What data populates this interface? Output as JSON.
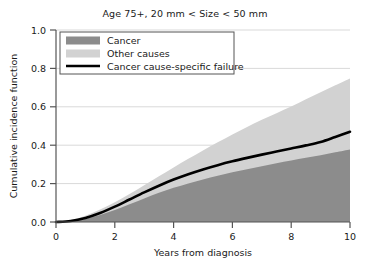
{
  "chart_data": {
    "type": "area",
    "title": "Age 75+, 20 mm < Size < 50 mm",
    "xlabel": "Years from diagnosis",
    "ylabel": "Cumulative incidence function",
    "xlim": [
      0,
      10
    ],
    "ylim": [
      0,
      1.0
    ],
    "xticks": [
      0,
      2,
      4,
      6,
      8,
      10
    ],
    "xtick_labels": [
      "0",
      "2",
      "4",
      "6",
      "8",
      "10"
    ],
    "yticks": [
      0.0,
      0.2,
      0.4,
      0.6,
      0.8,
      1.0
    ],
    "ytick_labels": [
      "0.0",
      "0.2",
      "0.4",
      "0.6",
      "0.8",
      "1.0"
    ],
    "grid": "horizontal",
    "stacked": true,
    "legend_position": "upper-left-inside",
    "x": [
      0,
      0.5,
      1,
      1.5,
      2,
      2.5,
      3,
      3.5,
      4,
      4.5,
      5,
      5.5,
      6,
      6.5,
      7,
      7.5,
      8,
      8.5,
      9,
      9.5,
      10
    ],
    "series": [
      {
        "name": "Cancer",
        "kind": "area",
        "color": "#8c8c8c",
        "values": [
          0.0,
          0.004,
          0.016,
          0.036,
          0.062,
          0.092,
          0.123,
          0.152,
          0.178,
          0.201,
          0.222,
          0.241,
          0.259,
          0.275,
          0.291,
          0.306,
          0.32,
          0.334,
          0.348,
          0.363,
          0.378
        ]
      },
      {
        "name": "Other causes",
        "kind": "area",
        "color": "#d2d2d2",
        "values": [
          0.0,
          0.01,
          0.033,
          0.065,
          0.103,
          0.146,
          0.192,
          0.238,
          0.284,
          0.329,
          0.373,
          0.415,
          0.456,
          0.495,
          0.532,
          0.567,
          0.601,
          0.639,
          0.676,
          0.712,
          0.748
        ],
        "note": "cumulative top of stack (Cancer + Other causes)"
      },
      {
        "name": "Cancer cause-specific failure",
        "kind": "line",
        "color": "#000000",
        "values": [
          0.0,
          0.005,
          0.021,
          0.047,
          0.08,
          0.117,
          0.154,
          0.189,
          0.221,
          0.249,
          0.274,
          0.296,
          0.316,
          0.334,
          0.351,
          0.367,
          0.383,
          0.399,
          0.417,
          0.443,
          0.47
        ]
      }
    ],
    "legend": [
      {
        "label": "Cancer",
        "marker": "swatch",
        "color": "#8c8c8c"
      },
      {
        "label": "Other causes",
        "marker": "swatch",
        "color": "#d2d2d2"
      },
      {
        "label": "Cancer cause-specific failure",
        "marker": "line",
        "color": "#000000"
      }
    ],
    "colors": {
      "cancer": "#8c8c8c",
      "other_causes": "#d2d2d2",
      "failure_line": "#000000",
      "grid": "#d9d9d9",
      "axis": "#555555",
      "background": "#ffffff"
    }
  }
}
